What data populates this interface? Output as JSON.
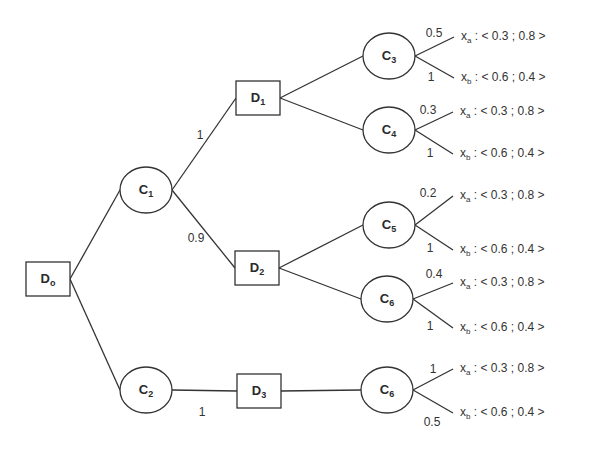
{
  "diagram": {
    "type": "decision-tree",
    "nodes": [
      {
        "id": "D0",
        "kind": "decision",
        "main": "D",
        "sub": "o",
        "x": 48,
        "y": 279
      },
      {
        "id": "C1",
        "kind": "chance",
        "main": "C",
        "sub": "1",
        "x": 146,
        "y": 190
      },
      {
        "id": "C2",
        "kind": "chance",
        "main": "C",
        "sub": "2",
        "x": 146,
        "y": 390
      },
      {
        "id": "D1",
        "kind": "decision",
        "main": "D",
        "sub": "1",
        "x": 258,
        "y": 98
      },
      {
        "id": "D2",
        "kind": "decision",
        "main": "D",
        "sub": "2",
        "x": 257,
        "y": 268
      },
      {
        "id": "D3",
        "kind": "decision",
        "main": "D",
        "sub": "3",
        "x": 259,
        "y": 391
      },
      {
        "id": "C3",
        "kind": "chance",
        "main": "C",
        "sub": "3",
        "x": 389,
        "y": 56
      },
      {
        "id": "C4",
        "kind": "chance",
        "main": "C",
        "sub": "4",
        "x": 389,
        "y": 130
      },
      {
        "id": "C5",
        "kind": "chance",
        "main": "C",
        "sub": "5",
        "x": 389,
        "y": 225
      },
      {
        "id": "C6a",
        "kind": "chance",
        "main": "C",
        "sub": "6",
        "x": 387,
        "y": 299
      },
      {
        "id": "C6b",
        "kind": "chance",
        "main": "C",
        "sub": "6",
        "x": 387,
        "y": 390
      }
    ],
    "edges": [
      {
        "from": "D0",
        "to": "C1",
        "label": ""
      },
      {
        "from": "D0",
        "to": "C2",
        "label": ""
      },
      {
        "from": "C1",
        "to": "D1",
        "label": "1",
        "lx": 200,
        "ly": 135
      },
      {
        "from": "C1",
        "to": "D2",
        "label": "0.9",
        "lx": 196,
        "ly": 238
      },
      {
        "from": "C2",
        "to": "D3",
        "label": "1",
        "lx": 202,
        "ly": 412
      },
      {
        "from": "D1",
        "to": "C3",
        "label": ""
      },
      {
        "from": "D1",
        "to": "C4",
        "label": ""
      },
      {
        "from": "D2",
        "to": "C5",
        "label": ""
      },
      {
        "from": "D2",
        "to": "C6a",
        "label": ""
      },
      {
        "from": "D3",
        "to": "C6b",
        "label": ""
      }
    ],
    "outcomes": [
      {
        "parent": "C3",
        "weight": "0.5",
        "wx": 434,
        "wy": 33,
        "ex": 456,
        "ey": 37,
        "var": "x",
        "sub": "a",
        "value": ": < 0.3 ; 0.8 >"
      },
      {
        "parent": "C3",
        "weight": "1",
        "wx": 431,
        "wy": 77,
        "ex": 456,
        "ey": 78,
        "var": "x",
        "sub": "b",
        "value": ": < 0.6 ; 0.4 >"
      },
      {
        "parent": "C4",
        "weight": "0.3",
        "wx": 428,
        "wy": 110,
        "ex": 455,
        "ey": 112,
        "var": "x",
        "sub": "a",
        "value": ": < 0.3 ; 0.8 >"
      },
      {
        "parent": "C4",
        "weight": "1",
        "wx": 430,
        "wy": 153,
        "ex": 455,
        "ey": 154,
        "var": "x",
        "sub": "b",
        "value": ": < 0.6 ; 0.4 >"
      },
      {
        "parent": "C5",
        "weight": "0.2",
        "wx": 428,
        "wy": 193,
        "ex": 455,
        "ey": 196,
        "var": "x",
        "sub": "a",
        "value": ": < 0.3 ; 0.8 >"
      },
      {
        "parent": "C5",
        "weight": "1",
        "wx": 430,
        "wy": 248,
        "ex": 455,
        "ey": 250,
        "var": "x",
        "sub": "b",
        "value": ": < 0.6 ; 0.4 >"
      },
      {
        "parent": "C6a",
        "weight": "0.4",
        "wx": 434,
        "wy": 274,
        "ex": 455,
        "ey": 283,
        "var": "x",
        "sub": "a",
        "value": ": < 0.3 ; 0.8 >"
      },
      {
        "parent": "C6a",
        "weight": "1",
        "wx": 430,
        "wy": 326,
        "ex": 455,
        "ey": 328,
        "var": "x",
        "sub": "b",
        "value": ": < 0.6 ; 0.4 >"
      },
      {
        "parent": "C6b",
        "weight": "1",
        "wx": 433,
        "wy": 369,
        "ex": 455,
        "ey": 369,
        "var": "x",
        "sub": "a",
        "value": ": < 0.3 ; 0.8 >"
      },
      {
        "parent": "C6b",
        "weight": "0.5",
        "wx": 432,
        "wy": 422,
        "ex": 455,
        "ey": 413,
        "var": "x",
        "sub": "b",
        "value": ": < 0.6 ; 0.4 >"
      }
    ]
  }
}
